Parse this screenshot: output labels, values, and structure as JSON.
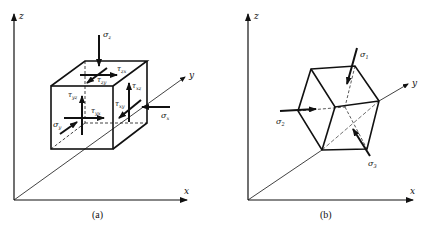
{
  "colors": {
    "ink": "#111111",
    "background": "#ffffff"
  },
  "panels": [
    {
      "caption": "(a)",
      "axes": {
        "x": "x",
        "y": "y",
        "z": "z"
      },
      "labels": {
        "sigma_z": "σ",
        "sigma_z_sub": "z",
        "sigma_x": "σ",
        "sigma_x_sub": "x",
        "sigma_y": "σ",
        "sigma_y_sub": "y",
        "tau_zx": "τ",
        "tau_zx_sub": "zx",
        "tau_zy": "τ",
        "tau_zy_sub": "zy",
        "tau_xz": "τ",
        "tau_xz_sub": "xz",
        "tau_xy": "τ",
        "tau_xy_sub": "xy",
        "tau_yz": "τ",
        "tau_yz_sub": "yz",
        "tau_yx": "τ",
        "tau_yx_sub": "yx"
      }
    },
    {
      "caption": "(b)",
      "axes": {
        "x": "x",
        "y": "y",
        "z": "z"
      },
      "labels": {
        "sigma_1": "σ",
        "sigma_1_sub": "1",
        "sigma_2": "σ",
        "sigma_2_sub": "2",
        "sigma_3": "σ",
        "sigma_3_sub": "3"
      }
    }
  ]
}
